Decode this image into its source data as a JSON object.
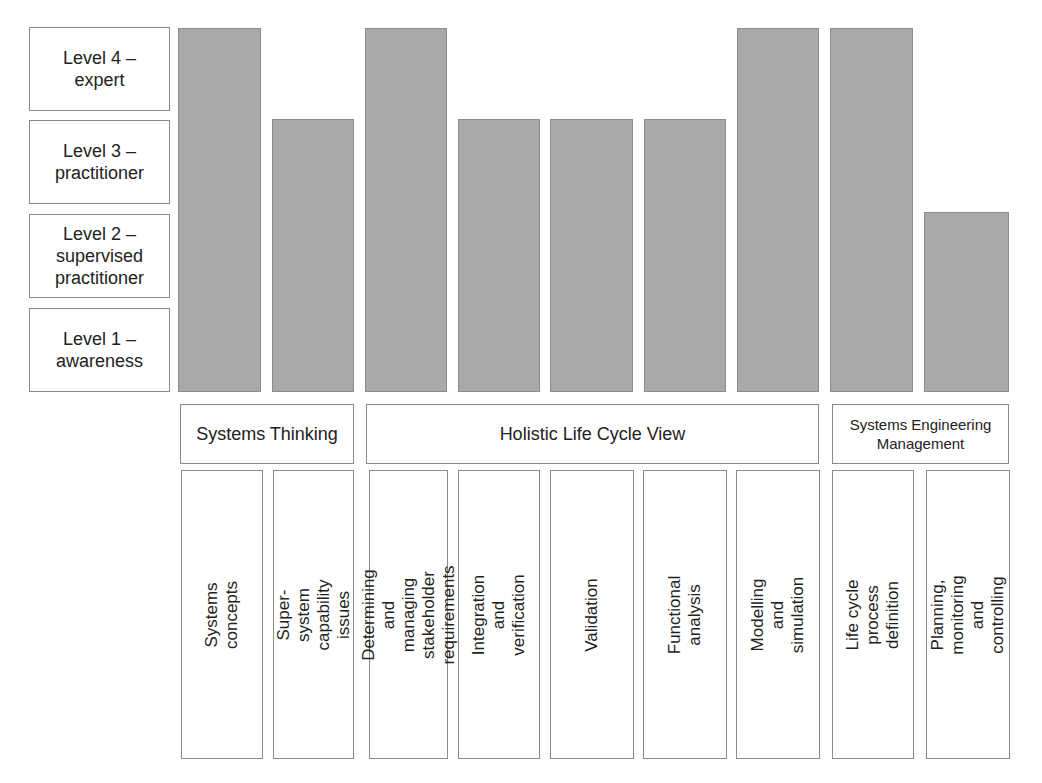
{
  "levels": [
    {
      "value": 4,
      "label": "Level 4 –\nexpert"
    },
    {
      "value": 3,
      "label": "Level 3 –\npractitioner"
    },
    {
      "value": 2,
      "label": "Level 2 –\nsupervised\npractitioner"
    },
    {
      "value": 1,
      "label": "Level 1 –\nawareness"
    }
  ],
  "groups": [
    {
      "label": "Systems Thinking"
    },
    {
      "label": "Holistic Life Cycle View"
    },
    {
      "label": "Systems Engineering\nManagement"
    }
  ],
  "competencies": [
    {
      "label": "Systems concepts",
      "group": "Systems Thinking",
      "level": 4
    },
    {
      "label": "Super-system capability\nissues",
      "group": "Systems Thinking",
      "level": 3
    },
    {
      "label": "Determining and managing\nstakeholder requirements",
      "group": "Holistic Life Cycle View",
      "level": 4
    },
    {
      "label": "Integration and verification",
      "group": "Holistic Life Cycle View",
      "level": 3
    },
    {
      "label": "Validation",
      "group": "Holistic Life Cycle View",
      "level": 3
    },
    {
      "label": "Functional analysis",
      "group": "Holistic Life Cycle View",
      "level": 3
    },
    {
      "label": "Modelling and simulation",
      "group": "Holistic Life Cycle View",
      "level": 4
    },
    {
      "label": "Life cycle process definition",
      "group": "Systems Engineering Management",
      "level": 4
    },
    {
      "label": "Planning, monitoring and\ncontrolling",
      "group": "Systems Engineering Management",
      "level": 2
    }
  ],
  "colors": {
    "bar_fill": "#a9a9a9",
    "bar_border": "#8c8c8c",
    "box_border": "#8a8a8a"
  },
  "chart_data": {
    "type": "bar",
    "title": "",
    "categories": [
      "Systems concepts",
      "Super-system capability issues",
      "Determining and managing stakeholder requirements",
      "Integration and verification",
      "Validation",
      "Functional analysis",
      "Modelling and simulation",
      "Life cycle process definition",
      "Planning, monitoring and controlling"
    ],
    "values": [
      4,
      3,
      4,
      3,
      3,
      3,
      4,
      4,
      2
    ],
    "category_groups": [
      {
        "name": "Systems Thinking",
        "categories": [
          "Systems concepts",
          "Super-system capability issues"
        ]
      },
      {
        "name": "Holistic Life Cycle View",
        "categories": [
          "Determining and managing stakeholder requirements",
          "Integration and verification",
          "Validation",
          "Functional analysis",
          "Modelling and simulation"
        ]
      },
      {
        "name": "Systems Engineering Management",
        "categories": [
          "Life cycle process definition",
          "Planning, monitoring and controlling"
        ]
      }
    ],
    "ytick_labels": [
      "Level 1 – awareness",
      "Level 2 – supervised practitioner",
      "Level 3 – practitioner",
      "Level 4 – expert"
    ],
    "xlabel": "",
    "ylabel": "",
    "ylim": [
      0,
      4
    ],
    "grid": false,
    "legend": "none"
  }
}
